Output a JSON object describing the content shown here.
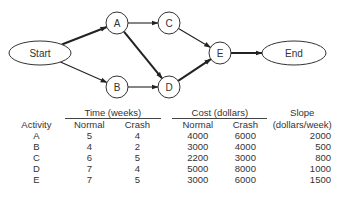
{
  "network": {
    "nodes": [
      {
        "id": "start",
        "label": "Start",
        "shape": "ellipse",
        "cx": 40,
        "cy": 53,
        "rx": 31,
        "ry": 12
      },
      {
        "id": "A",
        "label": "A",
        "shape": "circle",
        "cx": 117,
        "cy": 23,
        "r": 11
      },
      {
        "id": "B",
        "label": "B",
        "shape": "circle",
        "cx": 117,
        "cy": 87,
        "r": 11
      },
      {
        "id": "C",
        "label": "C",
        "shape": "circle",
        "cx": 169,
        "cy": 23,
        "r": 11
      },
      {
        "id": "D",
        "label": "D",
        "shape": "circle",
        "cx": 169,
        "cy": 87,
        "r": 11
      },
      {
        "id": "E",
        "label": "E",
        "shape": "circle",
        "cx": 220,
        "cy": 53,
        "r": 11
      },
      {
        "id": "end",
        "label": "End",
        "shape": "ellipse",
        "cx": 294,
        "cy": 53,
        "rx": 32,
        "ry": 12
      }
    ],
    "edges": [
      {
        "from": "start",
        "to": "A",
        "critical": true
      },
      {
        "from": "start",
        "to": "B",
        "critical": false
      },
      {
        "from": "A",
        "to": "C",
        "critical": false
      },
      {
        "from": "A",
        "to": "D",
        "critical": true
      },
      {
        "from": "B",
        "to": "D",
        "critical": false
      },
      {
        "from": "C",
        "to": "E",
        "critical": false
      },
      {
        "from": "D",
        "to": "E",
        "critical": true
      },
      {
        "from": "E",
        "to": "end",
        "critical": true
      }
    ]
  },
  "table": {
    "header": {
      "activity": "Activity",
      "time_group": "Time (weeks)",
      "cost_group": "Cost (dollars)",
      "slope_line1": "Slope",
      "slope_line2": "(dollars/week)",
      "normal": "Normal",
      "crash": "Crash"
    },
    "rows": [
      {
        "activity": "A",
        "time_normal": "5",
        "time_crash": "4",
        "cost_normal": "4000",
        "cost_crash": "6000",
        "slope": "2000"
      },
      {
        "activity": "B",
        "time_normal": "4",
        "time_crash": "2",
        "cost_normal": "3000",
        "cost_crash": "4000",
        "slope": "500"
      },
      {
        "activity": "C",
        "time_normal": "6",
        "time_crash": "5",
        "cost_normal": "2200",
        "cost_crash": "3000",
        "slope": "800"
      },
      {
        "activity": "D",
        "time_normal": "7",
        "time_crash": "4",
        "cost_normal": "5000",
        "cost_crash": "8000",
        "slope": "1000"
      },
      {
        "activity": "E",
        "time_normal": "7",
        "time_crash": "5",
        "cost_normal": "3000",
        "cost_crash": "6000",
        "slope": "1500"
      }
    ]
  }
}
